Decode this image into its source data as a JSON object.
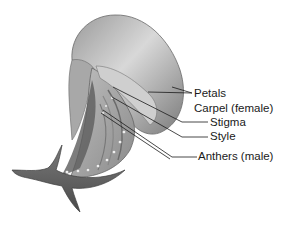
{
  "diagram": {
    "labels": [
      {
        "id": "petals",
        "text": "Petals"
      },
      {
        "id": "carpel",
        "text": "Carpel (female)"
      },
      {
        "id": "stigma",
        "text": "Stigma"
      },
      {
        "id": "style",
        "text": "Style"
      },
      {
        "id": "anthers",
        "text": "Anthers (male)"
      }
    ]
  },
  "colors": {
    "background": "#ffffff",
    "ink": "#1a1a1a",
    "petal_light": "#c9c9c9",
    "petal_dark": "#6e6e6e"
  }
}
